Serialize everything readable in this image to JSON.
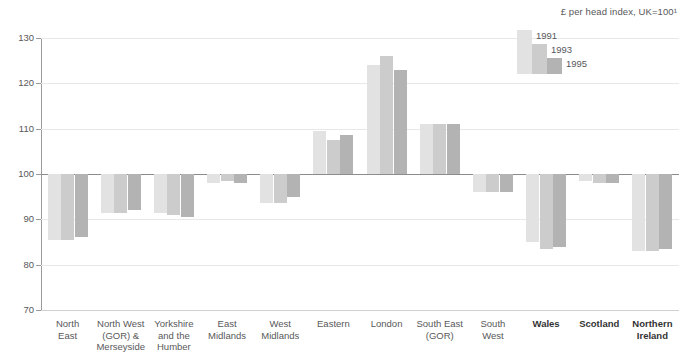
{
  "subtitle": "£ per head index, UK=100¹",
  "legend": {
    "items": [
      {
        "label": "1991",
        "color": "#e2e2e2"
      },
      {
        "label": "1993",
        "color": "#cccccc"
      },
      {
        "label": "1995",
        "color": "#b3b3b3"
      }
    ]
  },
  "axis": {
    "y_ticks": [
      "130",
      "120",
      "110",
      "100",
      "90",
      "80",
      "70"
    ]
  },
  "chart_data": {
    "type": "bar",
    "title": "",
    "subtitle": "£ per head index, UK=100¹",
    "xlabel": "",
    "ylabel": "",
    "ylim": [
      70,
      130
    ],
    "yticks": [
      70,
      80,
      90,
      100,
      110,
      120,
      130
    ],
    "grid": true,
    "baseline": 100,
    "legend_position": "top-right",
    "categories": [
      "North East",
      "North West (GOR) & Merseyside",
      "Yorkshire and the Humber",
      "East Midlands",
      "West Midlands",
      "Eastern",
      "London",
      "South East (GOR)",
      "South West",
      "Wales",
      "Scotland",
      "Northern Ireland"
    ],
    "category_lines": [
      [
        "North",
        "East"
      ],
      [
        "North West",
        "(GOR) &",
        "Merseyside"
      ],
      [
        "Yorkshire",
        "and the",
        "Humber"
      ],
      [
        "East",
        "Midlands"
      ],
      [
        "West",
        "Midlands"
      ],
      [
        "Eastern"
      ],
      [
        "London"
      ],
      [
        "South East",
        "(GOR)"
      ],
      [
        "South",
        "West"
      ],
      [
        "Wales"
      ],
      [
        "Scotland"
      ],
      [
        "Northern",
        "Ireland"
      ]
    ],
    "category_emphasis": [
      false,
      false,
      false,
      false,
      false,
      false,
      false,
      false,
      false,
      true,
      true,
      true
    ],
    "series": [
      {
        "name": "1991",
        "color": "#e2e2e2",
        "values": [
          85.5,
          91.5,
          91.5,
          98.0,
          93.5,
          109.5,
          124.0,
          111.0,
          96.0,
          85.0,
          98.5,
          83.0
        ]
      },
      {
        "name": "1993",
        "color": "#cccccc",
        "values": [
          85.5,
          91.5,
          91.0,
          98.5,
          93.5,
          107.5,
          126.0,
          111.0,
          96.0,
          83.5,
          98.0,
          83.0
        ]
      },
      {
        "name": "1995",
        "color": "#b3b3b3",
        "values": [
          86.0,
          92.0,
          90.5,
          98.0,
          95.0,
          108.5,
          123.0,
          111.0,
          96.0,
          84.0,
          98.0,
          83.5
        ]
      }
    ]
  }
}
